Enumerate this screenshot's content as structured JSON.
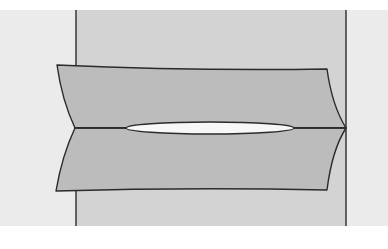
{
  "figure": {
    "colors": {
      "page": "#ffffff",
      "panel": "#ebebeb",
      "strip": "#d3d3d3",
      "plate": "#bcbcbc",
      "void": "#f7f7f7",
      "outline": "#2b2b2b"
    },
    "panel": {
      "x": 0,
      "y": 10,
      "width": 388,
      "height": 216
    },
    "strip": {
      "x_left": 76,
      "x_right": 346,
      "y_top": 10,
      "y_bottom": 226
    },
    "crack": {
      "y": 128,
      "x_start": 75,
      "x_end": 346
    },
    "void": {
      "cx": 210,
      "cy": 128,
      "rx": 84,
      "ry": 6
    },
    "upper_plate": {
      "top_left": [
        57,
        65
      ],
      "top_right": [
        327,
        69
      ],
      "tip_left": [
        75,
        128
      ],
      "tip_right": [
        346,
        128
      ]
    },
    "lower_plate": {
      "bottom_left": [
        56,
        191
      ],
      "bottom_right": [
        327,
        190
      ],
      "tip_left": [
        75,
        128
      ],
      "tip_right": [
        346,
        128
      ]
    }
  }
}
